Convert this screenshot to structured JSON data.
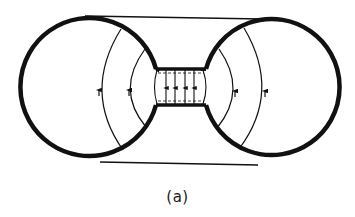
{
  "figure": {
    "caption": "(a)"
  },
  "colors": {
    "ink": "#111111",
    "background": "#ffffff"
  },
  "shapes": {
    "left_sphere": {
      "cx": 90,
      "cy": 90,
      "r": 69
    },
    "right_sphere": {
      "cx": 272,
      "cy": 92,
      "r": 68
    },
    "neck": {
      "x1": 156,
      "x2": 206,
      "top_y": 69,
      "bottom_y": 105
    },
    "neck_field_lines_x": [
      157,
      166,
      175,
      185,
      194,
      203
    ],
    "field_line_direction": "up"
  }
}
